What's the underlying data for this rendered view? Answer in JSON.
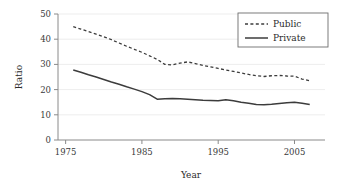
{
  "chart_data": {
    "type": "line",
    "title": "",
    "xlabel": "Year",
    "ylabel": "Ratio",
    "xlim": [
      1974,
      2009
    ],
    "ylim": [
      0,
      50
    ],
    "xticks": [
      1975,
      1985,
      1995,
      2005
    ],
    "yticks": [
      0,
      10,
      20,
      30,
      40,
      50
    ],
    "grid": "horizontal",
    "legend_position": "top-right",
    "x": [
      1976,
      1977,
      1978,
      1979,
      1980,
      1981,
      1982,
      1983,
      1984,
      1985,
      1986,
      1987,
      1988,
      1989,
      1990,
      1991,
      1992,
      1993,
      1994,
      1995,
      1996,
      1997,
      1998,
      1999,
      2000,
      2001,
      2002,
      2003,
      2004,
      2005,
      2006,
      2007
    ],
    "series": [
      {
        "name": "Public",
        "style": "dashed",
        "color": "#3c3c3c",
        "values": [
          45.0,
          44.0,
          43.0,
          42.0,
          41.0,
          39.8,
          38.5,
          37.2,
          36.0,
          34.8,
          33.4,
          32.0,
          30.0,
          29.8,
          30.5,
          31.0,
          30.3,
          29.6,
          29.0,
          28.4,
          27.8,
          27.2,
          26.6,
          26.0,
          25.5,
          25.2,
          25.5,
          25.6,
          25.4,
          25.3,
          24.2,
          23.5
        ]
      },
      {
        "name": "Private",
        "style": "solid",
        "color": "#3c3c3c",
        "values": [
          27.8,
          26.9,
          25.9,
          25.0,
          24.0,
          23.0,
          22.1,
          21.1,
          20.2,
          19.2,
          18.0,
          16.2,
          16.4,
          16.5,
          16.4,
          16.2,
          16.0,
          15.8,
          15.7,
          15.6,
          16.0,
          15.6,
          15.0,
          14.6,
          14.1,
          14.0,
          14.2,
          14.5,
          14.8,
          15.0,
          14.6,
          14.1
        ]
      }
    ],
    "legend": [
      {
        "label": "Public",
        "style": "dashed"
      },
      {
        "label": "Private",
        "style": "solid"
      }
    ]
  },
  "axis": {
    "y_title": "Ratio",
    "x_title": "Year",
    "y_tick_labels": [
      "0",
      "10",
      "20",
      "30",
      "40",
      "50"
    ],
    "x_tick_labels": [
      "1975",
      "1985",
      "1995",
      "2005"
    ]
  },
  "legend": {
    "public_label": "Public",
    "private_label": "Private"
  }
}
